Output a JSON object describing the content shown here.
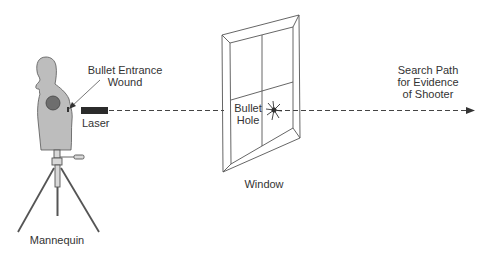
{
  "diagram": {
    "colors": {
      "background": "#ffffff",
      "line": "#555555",
      "mannequin_fill": "#bdbdbd",
      "target_fill": "#6e6e6e",
      "laser_fill": "#2b2b2b",
      "text": "#333333"
    },
    "labels": {
      "entrance_wound_line1": "Bullet Entrance",
      "entrance_wound_line2": "Wound",
      "laser": "Laser",
      "bullet_hole_line1": "Bullet",
      "bullet_hole_line2": "Hole",
      "window": "Window",
      "mannequin": "Mannequin",
      "search_path_line1": "Search Path",
      "search_path_line2": "for Evidence",
      "search_path_line3": "of Shooter"
    },
    "icons": {
      "mannequin": "mannequin-on-tripod",
      "laser": "laser-device",
      "window": "window-frame",
      "bullet_hole": "shattered-glass-hole",
      "arrow": "dashed-arrow-right"
    }
  }
}
